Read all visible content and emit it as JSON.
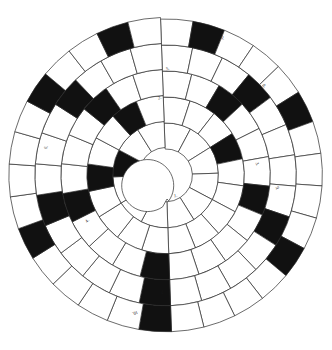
{
  "page": {
    "background_color": "#ffffff",
    "width": 332,
    "height": 350
  },
  "puzzle": {
    "type": "spiral-circular-crossword",
    "center": {
      "x": 166,
      "y": 175
    },
    "ring_count": 5,
    "hub_radius": 26,
    "ring_radii": [
      26,
      52,
      78,
      104,
      130,
      156
    ],
    "spiral_offset_deg": 4.5,
    "colors": {
      "grid_stroke": "#2b2b2b",
      "cell_fill": "#ffffff",
      "blocked_fill": "#111111",
      "label_color": "#1a1a1a"
    },
    "rings": [
      {
        "index": 0,
        "name": "ring-1-innermost",
        "cell_count": 12,
        "start_angle_deg": 92,
        "inner_radius": 26,
        "outer_radius": 52,
        "blocked_cells": [
          9
        ]
      },
      {
        "index": 1,
        "name": "ring-2",
        "cell_count": 18,
        "start_angle_deg": 92,
        "inner_radius": 52,
        "outer_radius": 78,
        "blocked_cells": [
          3,
          13,
          16
        ]
      },
      {
        "index": 2,
        "name": "ring-3",
        "cell_count": 22,
        "start_angle_deg": 92,
        "inner_radius": 78,
        "outer_radius": 104,
        "blocked_cells": [
          2,
          6,
          11,
          15,
          19
        ]
      },
      {
        "index": 3,
        "name": "ring-4",
        "cell_count": 26,
        "start_angle_deg": 92,
        "inner_radius": 104,
        "outer_radius": 130,
        "blocked_cells": [
          3,
          8,
          13,
          18,
          22
        ]
      },
      {
        "index": 4,
        "name": "ring-5-outermost",
        "cell_count": 30,
        "start_angle_deg": 92,
        "inner_radius": 130,
        "outer_radius": 156,
        "blocked_cells": [
          1,
          5,
          10,
          15,
          20,
          25,
          28
        ]
      }
    ],
    "clue_numbers": [
      {
        "id": "clue-1",
        "label": "1.",
        "x": 174,
        "y": 194,
        "rotation": -6
      },
      {
        "id": "clue-2",
        "label": "2.",
        "x": 158,
        "y": 96,
        "rotation": -14
      },
      {
        "id": "clue-3",
        "label": "3.",
        "x": 255,
        "y": 162,
        "rotation": 72
      },
      {
        "id": "clue-4",
        "label": "4.",
        "x": 86,
        "y": 219,
        "rotation": -48
      },
      {
        "id": "clue-5",
        "label": "5.",
        "x": 166,
        "y": 67,
        "rotation": -10
      },
      {
        "id": "clue-6",
        "label": "6.",
        "x": 45,
        "y": 145,
        "rotation": -72
      },
      {
        "id": "clue-7",
        "label": "7.",
        "x": 160,
        "y": 289,
        "rotation": 172
      },
      {
        "id": "clue-8",
        "label": "8.",
        "x": 262,
        "y": 84,
        "rotation": 48
      },
      {
        "id": "clue-9",
        "label": "9.",
        "x": 275,
        "y": 186,
        "rotation": 82
      },
      {
        "id": "clue-10",
        "label": "10.",
        "x": 132,
        "y": 310,
        "rotation": 160
      },
      {
        "id": "clue-11",
        "label": "11.",
        "x": 219,
        "y": 36,
        "rotation": 24
      }
    ]
  }
}
